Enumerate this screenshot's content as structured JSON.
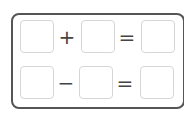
{
  "puzzle": {
    "rows": [
      {
        "operator": "+",
        "equals": "=",
        "cells": [
          "",
          "",
          ""
        ]
      },
      {
        "operator": "−",
        "equals": "=",
        "cells": [
          "",
          "",
          ""
        ]
      }
    ]
  },
  "colors": {
    "frame": "#555555",
    "cell_border": "#d6d6d6",
    "operator": "#444444"
  }
}
